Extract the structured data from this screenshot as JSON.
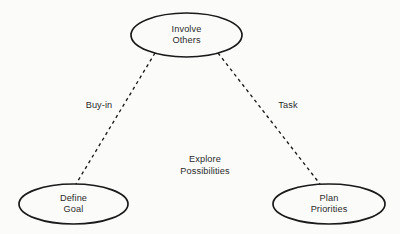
{
  "diagram": {
    "background_color": "#fbfbfa",
    "stroke_color": "#1a1a1a",
    "text_color": "#2b2b2b",
    "center_label": "Explore\nPossibilities",
    "nodes": [
      {
        "id": "involve-others",
        "label": "Involve\nOthers",
        "shape": "ellipse",
        "cx": 186.5,
        "cy": 35,
        "rx": 55.5,
        "ry": 22
      },
      {
        "id": "define-goal",
        "label": "Define\nGoal",
        "shape": "ellipse",
        "cx": 73.5,
        "cy": 204,
        "rx": 54.5,
        "ry": 20
      },
      {
        "id": "plan-priorities",
        "label": "Plan\nPriorities",
        "shape": "ellipse",
        "cx": 329,
        "cy": 204,
        "rx": 56,
        "ry": 20
      }
    ],
    "edges": [
      {
        "id": "buy-in",
        "label": "Buy-in",
        "from": "involve-others",
        "to": "define-goal",
        "style": "dashed",
        "x1": 155,
        "y1": 53,
        "x2": 76,
        "y2": 184,
        "label_x": 99,
        "label_y": 106
      },
      {
        "id": "task",
        "label": "Task",
        "from": "involve-others",
        "to": "plan-priorities",
        "style": "dashed",
        "x1": 218,
        "y1": 53,
        "x2": 320,
        "y2": 184,
        "label_x": 288,
        "label_y": 106
      }
    ]
  }
}
